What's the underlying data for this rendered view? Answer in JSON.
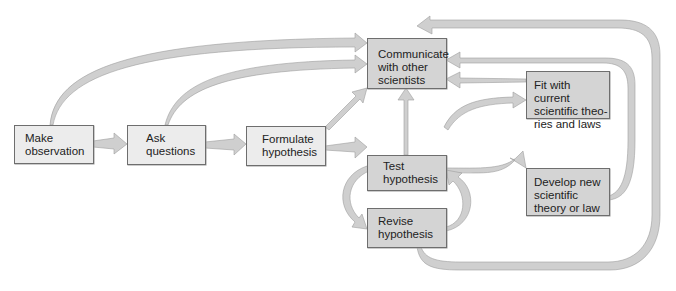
{
  "diagram": {
    "type": "flowchart",
    "title": "",
    "colors": {
      "box_light": "#ececec",
      "box_dark": "#d4d4d4",
      "arrow_fill": "#cfcfcf",
      "border": "#6e6e6e"
    },
    "nodes": [
      {
        "id": "make-observation",
        "label": "Make\nobservation",
        "style": "light"
      },
      {
        "id": "ask-questions",
        "label": "Ask\nquestions",
        "style": "light"
      },
      {
        "id": "formulate-hypothesis",
        "label": "Formulate\nhypothesis",
        "style": "light"
      },
      {
        "id": "communicate",
        "label": "Communicate\nwith other\nscientists",
        "style": "dark"
      },
      {
        "id": "test-hypothesis",
        "label": "Test\nhypothesis",
        "style": "dark"
      },
      {
        "id": "fit-current",
        "label": "Fit with current\nscientific theo-\nries and laws",
        "style": "dark"
      },
      {
        "id": "develop-new",
        "label": "Develop new\nscientific\ntheory or law",
        "style": "dark"
      },
      {
        "id": "revise-hypothesis",
        "label": "Revise\nhypothesis",
        "style": "dark"
      }
    ],
    "edges": [
      {
        "from": "make-observation",
        "to": "ask-questions"
      },
      {
        "from": "ask-questions",
        "to": "formulate-hypothesis"
      },
      {
        "from": "formulate-hypothesis",
        "to": "test-hypothesis"
      },
      {
        "from": "make-observation",
        "to": "communicate"
      },
      {
        "from": "ask-questions",
        "to": "communicate"
      },
      {
        "from": "formulate-hypothesis",
        "to": "communicate"
      },
      {
        "from": "test-hypothesis",
        "to": "communicate"
      },
      {
        "from": "test-hypothesis",
        "to": "fit-current"
      },
      {
        "from": "test-hypothesis",
        "to": "develop-new"
      },
      {
        "from": "test-hypothesis",
        "to": "revise-hypothesis"
      },
      {
        "from": "revise-hypothesis",
        "to": "test-hypothesis"
      },
      {
        "from": "fit-current",
        "to": "communicate"
      },
      {
        "from": "develop-new",
        "to": "communicate"
      },
      {
        "from": "revise-hypothesis",
        "to": "communicate"
      }
    ]
  }
}
